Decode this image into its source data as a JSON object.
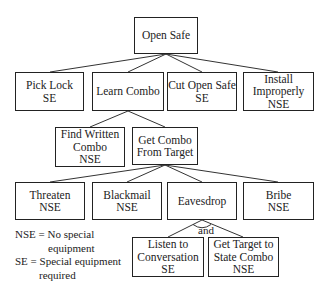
{
  "diagram": {
    "type": "attack-tree",
    "colors": {
      "line": "#222222",
      "background": "#ffffff",
      "text": "#222222"
    },
    "nodes": {
      "root": {
        "lines": [
          "Open Safe"
        ]
      },
      "pick_lock": {
        "lines": [
          "Pick Lock",
          "SE"
        ]
      },
      "learn_combo": {
        "lines": [
          "Learn Combo"
        ]
      },
      "cut_open": {
        "lines": [
          "Cut Open Safe",
          "SE"
        ]
      },
      "install_improperly": {
        "lines": [
          "Install",
          "Improperly",
          "NSE"
        ]
      },
      "find_written": {
        "lines": [
          "Find Written",
          "Combo",
          "NSE"
        ]
      },
      "get_from_target": {
        "lines": [
          "Get Combo",
          "From Target"
        ]
      },
      "threaten": {
        "lines": [
          "Threaten",
          "NSE"
        ]
      },
      "blackmail": {
        "lines": [
          "Blackmail",
          "NSE"
        ]
      },
      "eavesdrop": {
        "lines": [
          "Eavesdrop"
        ]
      },
      "bribe": {
        "lines": [
          "Bribe",
          "NSE"
        ]
      },
      "listen": {
        "lines": [
          "Listen to",
          "Conversation",
          "SE"
        ]
      },
      "state_combo": {
        "lines": [
          "Get Target to",
          "State Combo",
          "NSE"
        ]
      }
    },
    "edges": [
      [
        "root",
        "pick_lock"
      ],
      [
        "root",
        "learn_combo"
      ],
      [
        "root",
        "cut_open"
      ],
      [
        "root",
        "install_improperly"
      ],
      [
        "learn_combo",
        "find_written"
      ],
      [
        "learn_combo",
        "get_from_target"
      ],
      [
        "get_from_target",
        "threaten"
      ],
      [
        "get_from_target",
        "blackmail"
      ],
      [
        "get_from_target",
        "eavesdrop"
      ],
      [
        "get_from_target",
        "bribe"
      ],
      [
        "eavesdrop",
        "listen"
      ],
      [
        "eavesdrop",
        "state_combo"
      ]
    ],
    "and_label": "and",
    "legend": {
      "nse_line1": "NSE = No special",
      "nse_line2": "equipment",
      "se_line1": "SE = Special equipment",
      "se_line2": "required"
    }
  }
}
